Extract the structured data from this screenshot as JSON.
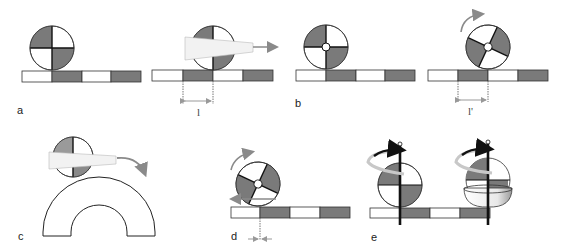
{
  "figure": {
    "colors": {
      "dark_segment": "#7a7a7a",
      "light_segment": "#ffffff",
      "outline": "#222222",
      "arrow": "#8a8a8a",
      "cone": "#f2f2f2"
    },
    "panels": [
      {
        "id": "a",
        "label": "a",
        "description": "Wheel with four alternating quadrants resting on striped bar"
      },
      {
        "id": "a2",
        "label": "",
        "measure_label": "l",
        "description": "Wheel translated by sliding arrow; displacement l marked with dotted lines"
      },
      {
        "id": "b",
        "label": "b",
        "description": "Wheel with hub resting on striped bar"
      },
      {
        "id": "b2",
        "label": "",
        "measure_label": "l'",
        "description": "Rotated wheel with curved rotation arrow; displacement l' marked"
      },
      {
        "id": "c",
        "label": "c",
        "description": "Half wheel with cone pointer rolling over arch"
      },
      {
        "id": "d",
        "label": "d",
        "description": "Wheel rotating with backward slip arrow; small contact offset marked"
      },
      {
        "id": "e",
        "label": "e",
        "description": "Wheel and sphere on vertical axis with spin arrows over striped bar"
      }
    ]
  }
}
